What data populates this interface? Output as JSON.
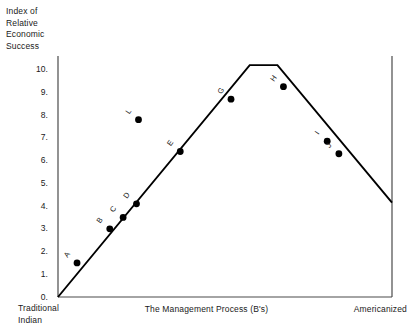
{
  "chart_data": {
    "type": "scatter",
    "title": "",
    "ylabel": "Index of Relative Economic Success",
    "ylabel_lines": [
      "Index of",
      "Relative",
      "Economic",
      "Success"
    ],
    "xlabel": "The Management Process (B's)",
    "x_left_caption_lines": [
      "Traditional",
      "Indian"
    ],
    "x_right_caption": "Americanized",
    "ylim": [
      0,
      10.6
    ],
    "xlim": [
      0,
      10
    ],
    "grid": false,
    "legend": false,
    "y_tick_labels": [
      "0.",
      "1.",
      "2.",
      "3.",
      "4.",
      "5.",
      "6.",
      "7.",
      "8.",
      "9.",
      "10."
    ],
    "y_tick_values": [
      0,
      1,
      2,
      3,
      4,
      5,
      6,
      7,
      8,
      9,
      10
    ],
    "x_tick_labels": [],
    "series": [
      {
        "name": "trend-line",
        "type": "line",
        "comment": "rises from origin to a short plateau at peak, then falls to right edge",
        "points": [
          {
            "x": 0.0,
            "y": 0.0
          },
          {
            "x": 5.74,
            "y": 10.2
          },
          {
            "x": 6.57,
            "y": 10.2
          },
          {
            "x": 10.0,
            "y": 4.15
          }
        ]
      },
      {
        "name": "data-points",
        "type": "scatter",
        "points": [
          {
            "label": "A",
            "x": 0.57,
            "y": 1.5
          },
          {
            "label": "B",
            "x": 1.55,
            "y": 3.0
          },
          {
            "label": "C",
            "x": 1.95,
            "y": 3.5
          },
          {
            "label": "D",
            "x": 2.35,
            "y": 4.1
          },
          {
            "label": "E",
            "x": 3.66,
            "y": 6.4
          },
          {
            "label": "G",
            "x": 5.18,
            "y": 8.7
          },
          {
            "label": "H",
            "x": 6.75,
            "y": 9.25
          },
          {
            "label": "I",
            "x": 8.06,
            "y": 6.85
          },
          {
            "label": "J",
            "x": 8.41,
            "y": 6.3
          },
          {
            "label": "L",
            "x": 2.41,
            "y": 7.8
          }
        ]
      }
    ],
    "colors": {
      "line": "#000000",
      "marker": "#000000",
      "axis": "#4a4a4a",
      "text": "#1a1a1a",
      "background": "#ffffff"
    }
  }
}
